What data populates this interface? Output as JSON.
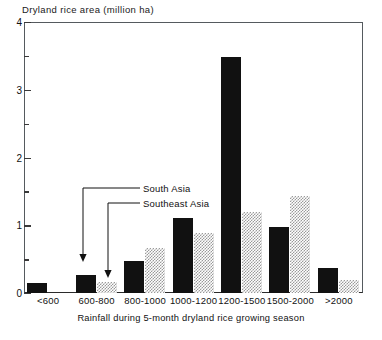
{
  "chart_data": {
    "type": "bar",
    "title": "Dryland rice area (million ha)",
    "xlabel": "Rainfall during 5-month dryland rice growing season",
    "ylabel": "Dryland rice area (million ha)",
    "categories": [
      "<600",
      "600-800",
      "800-1000",
      "1000-1200",
      "1200-1500",
      "1500-2000",
      ">2000"
    ],
    "series": [
      {
        "name": "South Asia",
        "color": "#111111",
        "fill": "solid-black",
        "values": [
          0.15,
          0.27,
          0.47,
          1.1,
          3.48,
          0.97,
          0.37
        ]
      },
      {
        "name": "Southeast Asia",
        "color": "#9a9a9a",
        "fill": "checkered-gray",
        "values": [
          0,
          0.16,
          0.66,
          0.89,
          1.2,
          1.43,
          0.19
        ]
      }
    ],
    "ylim": [
      0,
      4
    ],
    "ytick_labels": [
      "0",
      "1",
      "2",
      "3",
      "4"
    ],
    "ytick_values": [
      0,
      1,
      2,
      3,
      4
    ],
    "yminor_values": [
      0.5,
      1.5,
      2.5,
      3.5
    ],
    "grid": false,
    "legend": "annotated-arrows",
    "annotations": [
      {
        "label": "South Asia",
        "points_to_series": "South Asia",
        "points_to_category": "600-800"
      },
      {
        "label": "Southeast Asia",
        "points_to_series": "Southeast Asia",
        "points_to_category": "600-800"
      }
    ]
  }
}
